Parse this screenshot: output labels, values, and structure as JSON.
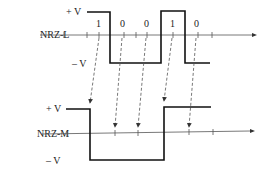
{
  "diagram": {
    "title": "",
    "top": {
      "name": "NRZ-L",
      "plus_label": "+ V",
      "minus_label": "– V",
      "bits": [
        "1",
        "0",
        "0",
        "1",
        "0"
      ]
    },
    "bottom": {
      "name": "NRZ-M",
      "plus_label": "+ V",
      "minus_label": "– V"
    }
  }
}
